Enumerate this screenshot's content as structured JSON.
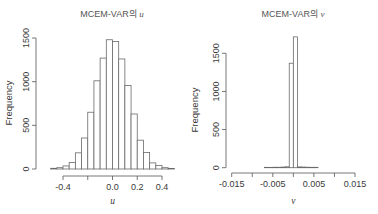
{
  "chart_data": [
    {
      "type": "bar",
      "subtype": "histogram",
      "title": "MCEM-VAR의 u",
      "title_prefix": "MCEM-VAR의",
      "title_var": "u",
      "xlabel": "u",
      "ylabel": "Frequency",
      "xlim": [
        -0.5,
        0.5
      ],
      "ylim": [
        0,
        1500
      ],
      "xticks": [
        "-0.4",
        "0.0",
        "0.2",
        "0.4"
      ],
      "xtick_values": [
        -0.4,
        -0.2,
        0.0,
        0.2,
        0.4
      ],
      "yticks": [
        "0",
        "500",
        "1000",
        "1500"
      ],
      "ytick_values": [
        0,
        500,
        1000,
        1500
      ],
      "bin_width": 0.05,
      "bins": [
        -0.5,
        -0.45,
        -0.4,
        -0.35,
        -0.3,
        -0.25,
        -0.2,
        -0.15,
        -0.1,
        -0.05,
        0.0,
        0.05,
        0.1,
        0.15,
        0.2,
        0.25,
        0.3,
        0.35,
        0.4,
        0.45,
        0.5
      ],
      "values": [
        8,
        15,
        35,
        75,
        185,
        355,
        650,
        1010,
        1270,
        1480,
        1460,
        1260,
        955,
        630,
        330,
        190,
        70,
        40,
        15,
        6
      ],
      "grid": false,
      "legend": null
    },
    {
      "type": "bar",
      "subtype": "histogram",
      "title": "MCEM-VAR의 v",
      "title_prefix": "MCEM-VAR의",
      "title_var": "v",
      "xlabel": "v",
      "ylabel": "Frequency",
      "xlim": [
        -0.015,
        0.015
      ],
      "ylim": [
        0,
        1700
      ],
      "xticks": [
        "-0.015",
        "-0.005",
        "0.005",
        "0.015"
      ],
      "xtick_values": [
        -0.015,
        -0.01,
        -0.005,
        0.0,
        0.005,
        0.01,
        0.015
      ],
      "yticks": [
        "0",
        "500",
        "1000",
        "1500"
      ],
      "ytick_values": [
        0,
        500,
        1000,
        1500
      ],
      "bin_width": 0.001,
      "bins": [
        -0.007,
        -0.006,
        -0.005,
        -0.004,
        -0.003,
        -0.002,
        -0.001,
        0.0,
        0.001,
        0.002,
        0.003,
        0.004,
        0.005,
        0.006
      ],
      "values": [
        5,
        4,
        6,
        5,
        8,
        12,
        1370,
        1715,
        10,
        8,
        6,
        5,
        5
      ],
      "grid": false,
      "legend": null
    }
  ]
}
